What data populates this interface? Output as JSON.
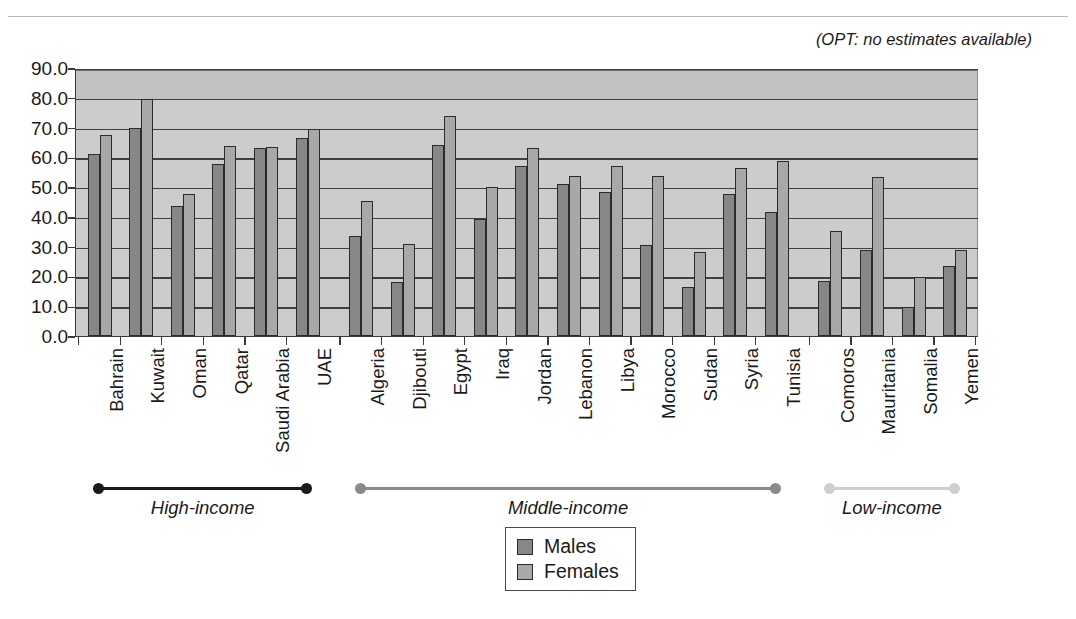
{
  "annotation": "(OPT: no estimates available)",
  "title_fragment": "",
  "legend": {
    "position": "bottom-center",
    "entries": [
      {
        "label": "Males",
        "color": "#878787"
      },
      {
        "label": "Females",
        "color": "#a8a8a8"
      }
    ]
  },
  "income_groups": [
    {
      "label": "High-income",
      "color": "#1a1a1a",
      "start_index": 0,
      "end_index": 5
    },
    {
      "label": "Middle-income",
      "color": "#8a8a8a",
      "start_index": 6,
      "end_index": 16
    },
    {
      "label": "Low-income",
      "color": "#cfcfcf",
      "start_index": 17,
      "end_index": 20
    }
  ],
  "chart_data": {
    "type": "bar",
    "title": "",
    "xlabel": "",
    "ylabel": "",
    "ylim": [
      0.0,
      90.0
    ],
    "yticks": [
      "0.0",
      "10.0",
      "20.0",
      "30.0",
      "40.0",
      "50.0",
      "60.0",
      "70.0",
      "80.0",
      "90.0"
    ],
    "grid": true,
    "legend_position": "bottom-center",
    "categories": [
      "Bahrain",
      "Kuwait",
      "Oman",
      "Qatar",
      "Saudi Arabia",
      "UAE",
      "Algeria",
      "Djibouti",
      "Egypt",
      "Iraq",
      "Jordan",
      "Lebanon",
      "Libya",
      "Morocco",
      "Sudan",
      "Syria",
      "Tunisia",
      "Comoros",
      "Mauritania",
      "Somalia",
      "Yemen"
    ],
    "series": [
      {
        "name": "Males",
        "color": "#878787",
        "values": [
          61.0,
          69.8,
          43.5,
          57.6,
          63.0,
          66.5,
          33.7,
          18.2,
          64.2,
          39.2,
          57.2,
          51.0,
          48.5,
          30.5,
          16.5,
          47.6,
          41.8,
          18.5,
          29.0,
          9.6,
          23.6
        ]
      },
      {
        "name": "Females",
        "color": "#a8a8a8",
        "values": [
          67.4,
          79.6,
          47.8,
          63.9,
          63.4,
          69.6,
          45.4,
          30.8,
          73.9,
          50.2,
          63.0,
          53.8,
          57.0,
          53.7,
          28.2,
          56.5,
          58.8,
          35.1,
          53.5,
          19.9,
          28.8
        ]
      }
    ]
  }
}
